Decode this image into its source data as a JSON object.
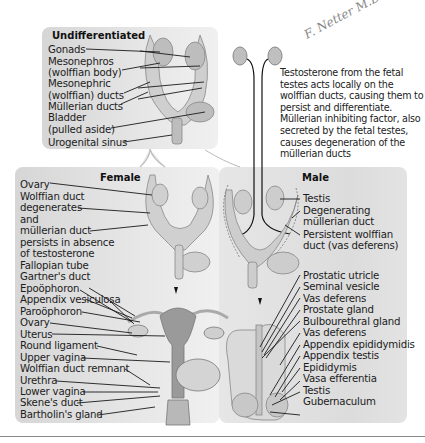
{
  "signature": "F. Netter M.D.",
  "undifferentiated": {
    "title": "Undifferentiated",
    "labels": [
      "Gonads",
      "Mesonephros",
      "(wolffian body)",
      "Mesonephric",
      "(wolffian) ducts",
      "Müllerian ducts",
      "Bladder",
      "(pulled aside)",
      "Urogenital sinus"
    ]
  },
  "note": "Testosterone from the fetal testes acts locally on the wolffian ducts, causing them to persist and differentiate. Müllerian inhibiting factor, also secreted by the fetal testes, causes degeneration of the müllerian ducts",
  "female": {
    "title": "Female",
    "upper_labels": [
      "Ovary",
      "Wolffian duct",
      "degenerates",
      "and",
      "müllerian duct",
      "persists in absence",
      "of testosterone"
    ],
    "lower_labels": [
      "Fallopian tube",
      "Gartner's duct",
      "Epoöphoron",
      "Appendix vesiculosa",
      "Paroöphoron",
      "Ovary",
      "Uterus",
      "Round ligament",
      "Upper vagina",
      "Wolffian duct remnant",
      "Urethra",
      "Lower vagina",
      "Skene's duct",
      "Bartholin's gland"
    ]
  },
  "male": {
    "title": "Male",
    "upper_labels": [
      "Testis",
      "Degenerating",
      "müllerian duct",
      "Persistent wolffian",
      "duct (vas deferens)"
    ],
    "lower_labels": [
      "Prostatic utricle",
      "Seminal vesicle",
      "Vas deferens",
      "Prostate gland",
      "Bulbourethral gland",
      "Vas deferens",
      "Appendix epididymidis",
      "Appendix testis",
      "Epididymis",
      "Vasa efferentia",
      "Testis",
      "Gubernaculum"
    ]
  }
}
